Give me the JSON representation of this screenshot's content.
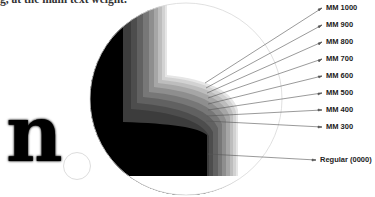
{
  "caption": "g, at the main text weight.",
  "glyph": "n",
  "labels": [
    {
      "text": "MM 1000",
      "y": 5
    },
    {
      "text": "MM 900",
      "y": 22
    },
    {
      "text": "MM 800",
      "y": 39
    },
    {
      "text": "MM 700",
      "y": 56
    },
    {
      "text": "MM 600",
      "y": 73
    },
    {
      "text": "MM 500",
      "y": 90
    },
    {
      "text": "MM 400",
      "y": 107
    },
    {
      "text": "MM 300",
      "y": 124
    },
    {
      "text": "Regular (0000)",
      "y": 157
    }
  ],
  "colors": {
    "circle_outline": "#d8d8d8",
    "leader_line": "#555555",
    "label_text": "#222222"
  }
}
